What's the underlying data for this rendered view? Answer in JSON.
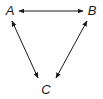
{
  "diagram": {
    "type": "triangle-bidirectional-graph",
    "nodes": [
      {
        "id": "A",
        "label": "A"
      },
      {
        "id": "B",
        "label": "B"
      },
      {
        "id": "C",
        "label": "C"
      }
    ],
    "edges": [
      {
        "from": "A",
        "to": "B",
        "direction": "bidirectional"
      },
      {
        "from": "A",
        "to": "C",
        "direction": "bidirectional"
      },
      {
        "from": "B",
        "to": "C",
        "direction": "bidirectional"
      }
    ],
    "colors": {
      "stroke": "#1a1a1a",
      "background": "#ffffff"
    }
  }
}
